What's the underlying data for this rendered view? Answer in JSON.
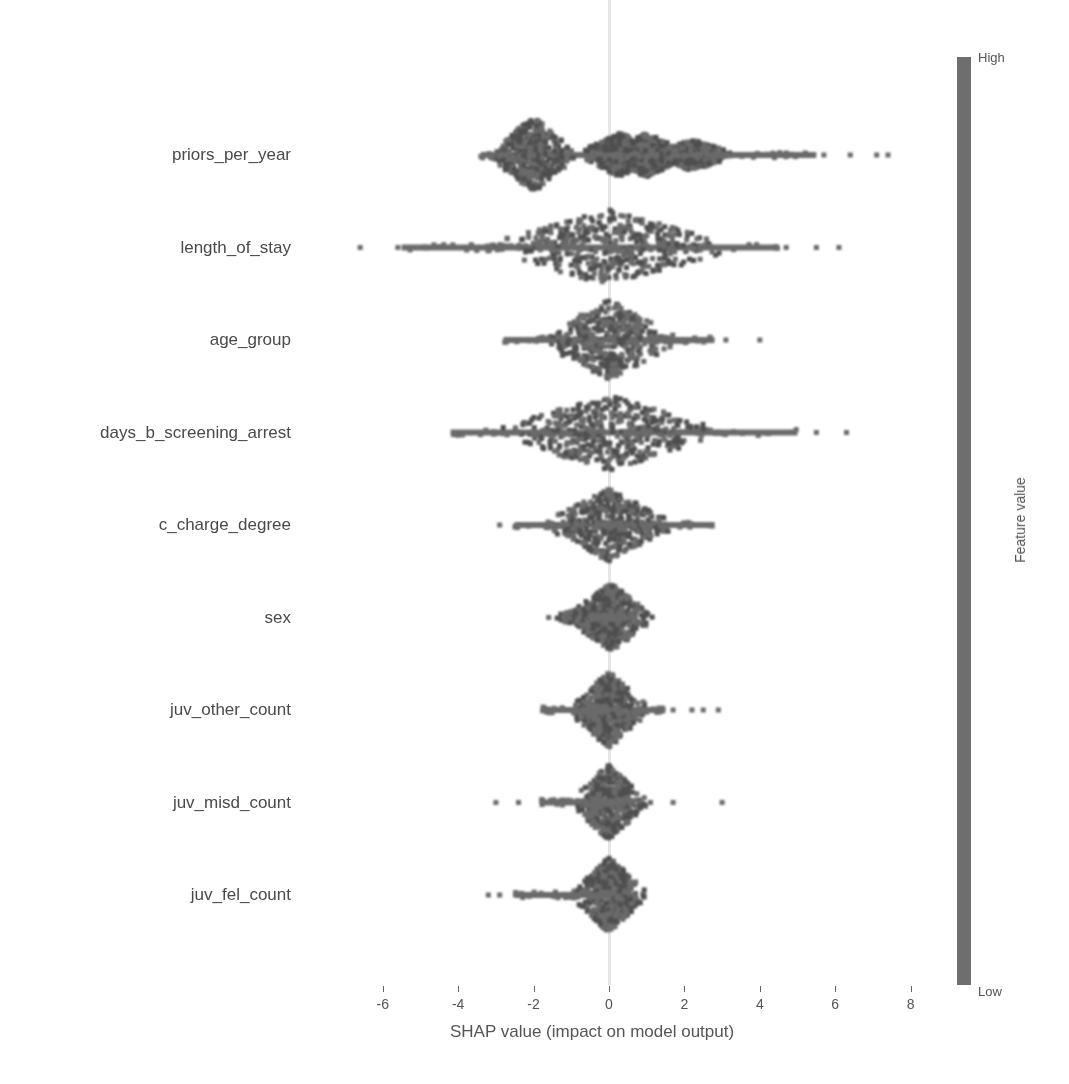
{
  "chart_data": {
    "type": "scatter",
    "subtype": "shap_beeswarm_summary",
    "title": "",
    "xlabel": "SHAP value (impact on model output)",
    "ylabel": "",
    "xlim": [
      -6.5,
      8.5
    ],
    "x_ticks": [
      -6,
      -4,
      -2,
      0,
      2,
      4,
      6,
      8
    ],
    "x_tick_labels": [
      "-6",
      "-4",
      "-2",
      "0",
      "2",
      "4",
      "6",
      "8"
    ],
    "grid": false,
    "zero_line": true,
    "legend_position": "right-colorbar",
    "colorbar": {
      "label": "Feature value",
      "high_label": "High",
      "low_label": "Low"
    },
    "features": [
      {
        "name": "priors_per_year",
        "min": -3.9,
        "max": 7.5,
        "outliers": [
          5.7,
          6.4,
          7.1,
          7.4
        ],
        "density_peaks": [
          {
            "x": -2.0,
            "h": 38
          },
          {
            "x": 0.3,
            "h": 22
          },
          {
            "x": 1.0,
            "h": 22
          },
          {
            "x": 2.2,
            "h": 16
          }
        ],
        "core_range": [
          -3.4,
          5.5
        ]
      },
      {
        "name": "length_of_stay",
        "min": -6.6,
        "max": 6.1,
        "outliers": [
          -6.6,
          -5.6,
          4.7,
          5.5,
          6.1
        ],
        "density_peaks": [
          {
            "x": 0.0,
            "h": 38
          }
        ],
        "core_range": [
          -5.5,
          4.5
        ]
      },
      {
        "name": "age_group",
        "min": -2.8,
        "max": 4.0,
        "outliers": [
          3.1,
          4.0
        ],
        "density_peaks": [
          {
            "x": 0.0,
            "h": 40
          }
        ],
        "core_range": [
          -2.8,
          2.8
        ]
      },
      {
        "name": "days_b_screening_arrest",
        "min": -4.2,
        "max": 6.3,
        "outliers": [
          5.5,
          6.3
        ],
        "density_peaks": [
          {
            "x": 0.0,
            "h": 38
          }
        ],
        "core_range": [
          -4.2,
          5.0
        ]
      },
      {
        "name": "c_charge_degree",
        "min": -2.9,
        "max": 2.8,
        "outliers": [
          -2.9
        ],
        "density_peaks": [
          {
            "x": 0.0,
            "h": 36
          }
        ],
        "core_range": [
          -2.5,
          2.8
        ]
      },
      {
        "name": "sex",
        "min": -1.6,
        "max": 0.4,
        "outliers": [
          -1.6,
          -1.2,
          -0.8
        ],
        "density_peaks": [
          {
            "x": 0.05,
            "h": 34
          },
          {
            "x": -0.4,
            "h": 12
          }
        ],
        "core_range": [
          -0.5,
          0.4
        ]
      },
      {
        "name": "juv_other_count",
        "min": -1.8,
        "max": 2.9,
        "outliers": [
          1.7,
          2.2,
          2.5,
          2.9
        ],
        "density_peaks": [
          {
            "x": 0.0,
            "h": 38
          }
        ],
        "core_range": [
          -1.8,
          1.5
        ]
      },
      {
        "name": "juv_misd_count",
        "min": -3.0,
        "max": 3.0,
        "outliers": [
          -3.0,
          -2.4,
          1.1,
          1.7,
          3.0
        ],
        "density_peaks": [
          {
            "x": 0.0,
            "h": 38
          }
        ],
        "core_range": [
          -1.8,
          0.6
        ]
      },
      {
        "name": "juv_fel_count",
        "min": -3.2,
        "max": 0.3,
        "outliers": [
          -3.2,
          -2.9,
          -1.3
        ],
        "density_peaks": [
          {
            "x": 0.0,
            "h": 38
          }
        ],
        "core_range": [
          -2.5,
          0.3
        ]
      }
    ],
    "colors": {
      "points": "#6a6a6a",
      "points_dark": "#4e4e4e",
      "zero_line": "#e6e6e6",
      "colorbar": "#6e6e6e",
      "text": "#555555"
    }
  }
}
